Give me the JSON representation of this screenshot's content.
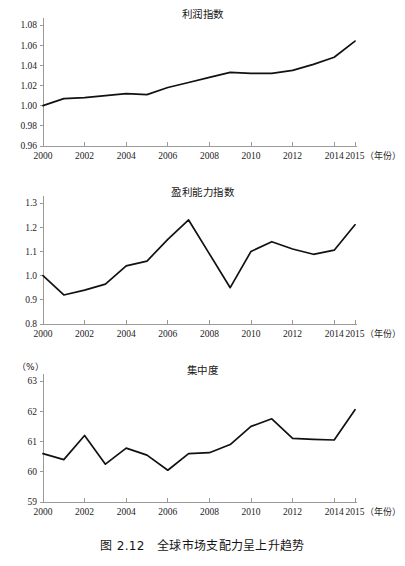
{
  "figure": {
    "caption": "图 2.12　全球市场支配力呈上升趋势",
    "x_axis_unit_label": "（年份）"
  },
  "chart_data": [
    {
      "type": "line",
      "title": "利润指数",
      "xlabel": "（年份）",
      "ylabel": "",
      "unit_label": "",
      "grid": false,
      "legend": "none",
      "xlim": [
        2000,
        2015
      ],
      "ylim": [
        0.96,
        1.08
      ],
      "yticks": [
        "0.96",
        "0.98",
        "1.00",
        "1.02",
        "1.04",
        "1.06",
        "1.08"
      ],
      "xticks": [
        "2000",
        "2002",
        "2004",
        "2006",
        "2008",
        "2010",
        "2012",
        "2014",
        "2015"
      ],
      "x": [
        2000,
        2001,
        2002,
        2003,
        2004,
        2005,
        2006,
        2007,
        2008,
        2009,
        2010,
        2011,
        2012,
        2013,
        2014,
        2015
      ],
      "values": [
        1.0,
        1.007,
        1.008,
        1.01,
        1.012,
        1.011,
        1.018,
        1.023,
        1.028,
        1.033,
        1.032,
        1.032,
        1.035,
        1.041,
        1.048,
        1.064
      ]
    },
    {
      "type": "line",
      "title": "盈利能力指数",
      "xlabel": "（年份）",
      "ylabel": "",
      "unit_label": "",
      "grid": false,
      "legend": "none",
      "xlim": [
        2000,
        2015
      ],
      "ylim": [
        0.8,
        1.3
      ],
      "yticks": [
        "0.8",
        "0.9",
        "1.0",
        "1.1",
        "1.2",
        "1.3"
      ],
      "xticks": [
        "2000",
        "2002",
        "2004",
        "2006",
        "2008",
        "2010",
        "2012",
        "2014",
        "2015"
      ],
      "x": [
        2000,
        2001,
        2002,
        2003,
        2004,
        2005,
        2006,
        2007,
        2008,
        2009,
        2010,
        2011,
        2012,
        2013,
        2014,
        2015
      ],
      "values": [
        1.0,
        0.92,
        0.94,
        0.965,
        1.04,
        1.06,
        1.15,
        1.23,
        1.09,
        0.95,
        1.1,
        1.14,
        1.11,
        1.088,
        1.105,
        1.21
      ]
    },
    {
      "type": "line",
      "title": "集中度",
      "xlabel": "（年份）",
      "ylabel": "",
      "unit_label": "（%）",
      "grid": false,
      "legend": "none",
      "xlim": [
        2000,
        2015
      ],
      "ylim": [
        59,
        63
      ],
      "yticks": [
        "59",
        "60",
        "61",
        "62",
        "63"
      ],
      "xticks": [
        "2000",
        "2002",
        "2004",
        "2006",
        "2008",
        "2010",
        "2012",
        "2014",
        "2015"
      ],
      "x": [
        2000,
        2001,
        2002,
        2003,
        2004,
        2005,
        2006,
        2007,
        2008,
        2009,
        2010,
        2011,
        2012,
        2013,
        2014,
        2015
      ],
      "values": [
        60.6,
        60.4,
        61.2,
        60.25,
        60.78,
        60.55,
        60.05,
        60.6,
        60.63,
        60.9,
        61.5,
        61.75,
        61.1,
        61.07,
        61.05,
        62.05
      ]
    }
  ]
}
